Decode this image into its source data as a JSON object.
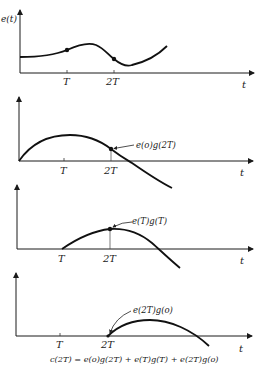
{
  "figure": {
    "panels": [
      {
        "id": "input-signal",
        "y_label": "e(t)",
        "x_label": "t",
        "ticks": [
          "T",
          "2T"
        ],
        "annotation": ""
      },
      {
        "id": "response-to-e0",
        "y_label": "",
        "x_label": "t",
        "ticks": [
          "T",
          "2T"
        ],
        "annotation": "e(o)g(2T)"
      },
      {
        "id": "response-to-eT",
        "y_label": "",
        "x_label": "t",
        "ticks": [
          "T",
          "2T"
        ],
        "annotation": "e(T)g(T)"
      },
      {
        "id": "response-to-e2T",
        "y_label": "",
        "x_label": "t",
        "ticks": [
          "T",
          "2T"
        ],
        "annotation": "e(2T)g(o)"
      }
    ],
    "equation": "c(2T) = e(o)g(2T) + e(T)g(T) + e(2T)g(o)"
  }
}
